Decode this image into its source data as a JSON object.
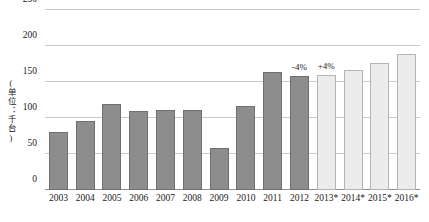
{
  "chart_data": {
    "type": "bar",
    "title": "",
    "xlabel": "",
    "ylabel": "(单位：千台)",
    "ylim": [
      0,
      250
    ],
    "yticks": [
      0,
      50,
      100,
      150,
      200,
      250
    ],
    "grid": true,
    "legend": "none",
    "categories": [
      "2003",
      "2004",
      "2005",
      "2006",
      "2007",
      "2008",
      "2009",
      "2010",
      "2011",
      "2012",
      "2013*",
      "2014*",
      "2015*",
      "2016*"
    ],
    "values": [
      81,
      96,
      119,
      110,
      111,
      111,
      59,
      117,
      164,
      158,
      160,
      166,
      176,
      189
    ],
    "series": [
      {
        "name": "销量",
        "values": [
          81,
          96,
          119,
          110,
          111,
          111,
          59,
          117,
          164,
          158,
          160,
          166,
          176,
          189
        ]
      }
    ],
    "bar_styles": [
      "actual",
      "actual",
      "actual",
      "actual",
      "actual",
      "actual",
      "actual",
      "actual",
      "actual",
      "actual",
      "forecast",
      "forecast",
      "forecast",
      "forecast"
    ],
    "annotations": [
      {
        "category": "2012",
        "text": "-4%"
      },
      {
        "category": "2013*",
        "text": "+4%"
      }
    ],
    "colors": {
      "actual_fill": "#8d8d8d",
      "actual_border": "#6f6f6f",
      "forecast_fill": "#ececec",
      "forecast_border": "#b4b4b4",
      "gridline": "#c9c9c9",
      "axis": "#8f8f8f",
      "text": "#1a1a1a"
    }
  }
}
